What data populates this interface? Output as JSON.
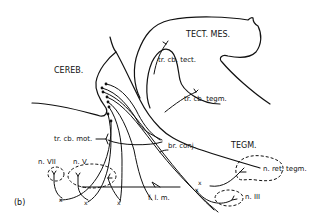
{
  "figure": {
    "panel_label": "(b)",
    "regions": {
      "cerebellum": "CEREB.",
      "tectum": "TECT. MES.",
      "tegmentum": "TEGM."
    },
    "tracts": {
      "cerebellotectal": "tr. cb. tect.",
      "cerebellotegmental": "tr. cb. tegm.",
      "cerebellomotor": "tr. cb. mot.",
      "brachium": "br. conj.",
      "flm": "f. l. m."
    },
    "nuclei": {
      "n7": "n. VII",
      "n5": "n. V",
      "ret_tegm": "n. ret. tegm.",
      "n3": "n. III"
    },
    "decussation_mark": "x"
  }
}
